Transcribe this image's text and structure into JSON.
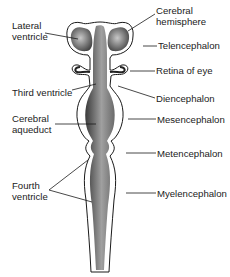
{
  "diagram": {
    "labels": {
      "lateral_ventricle": [
        "Lateral",
        "ventricle"
      ],
      "cerebral_hemisphere": [
        "Cerebral",
        "hemisphere"
      ],
      "telencephalon": "Telencephalon",
      "retina_of_eye": "Retina of eye",
      "third_ventricle": "Third ventricle",
      "diencephalon": "Diencephalon",
      "cerebral_aqueduct": [
        "Cerebral",
        "aqueduct"
      ],
      "mesencephalon": "Mesencephalon",
      "metencephalon": "Metencephalon",
      "fourth_ventricle": [
        "Fourth",
        "ventricle"
      ],
      "myelencephalon": "Myelencephalon"
    },
    "colors": {
      "ink": "#1a1a1a",
      "shade_dark": "#4a4a4a",
      "shade_light": "#b8b8b8"
    }
  }
}
